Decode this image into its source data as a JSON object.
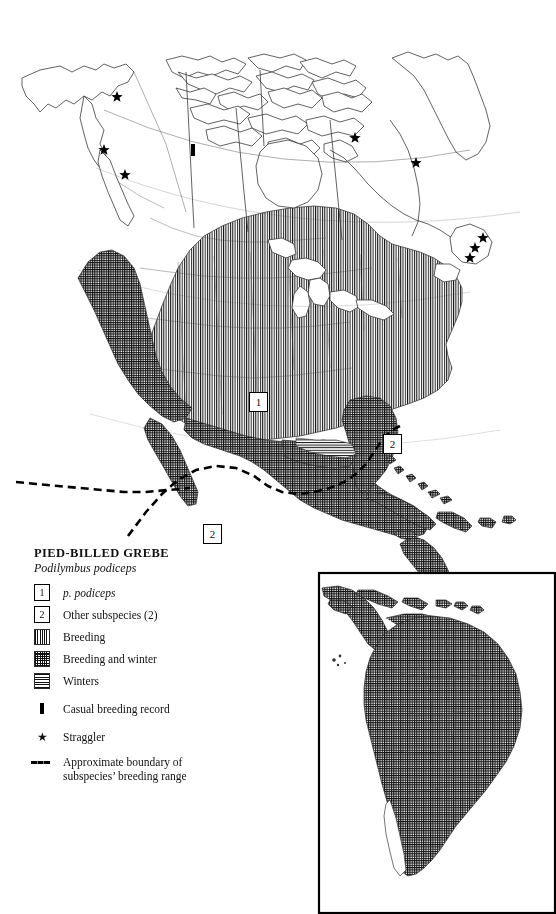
{
  "map": {
    "kind": "species-range-map",
    "region": "North America with South America inset",
    "background_color": "#ffffff",
    "ink_color": "#111111"
  },
  "legend": {
    "title": "PIED-BILLED  GREBE",
    "scientific_name": "Podilymbus podiceps",
    "subspecies": [
      {
        "number": "1",
        "label": "p. podiceps",
        "italic": true
      },
      {
        "number": "2",
        "label": "Other subspecies  (2)",
        "italic": false
      }
    ],
    "patterns": [
      {
        "swatch": "vertical-lines",
        "label": "Breeding"
      },
      {
        "swatch": "cross-hatch",
        "label": "Breeding and winter"
      },
      {
        "swatch": "horizontal-lines",
        "label": "Winters"
      }
    ],
    "marks": [
      {
        "symbol": "bar",
        "label": "Casual breeding record"
      },
      {
        "symbol": "star",
        "label": "Straggler",
        "glyph": "★"
      },
      {
        "symbol": "dashed-line",
        "label_line1": "Approximate boundary of",
        "label_line2": "subspecies’ breeding range"
      }
    ]
  },
  "map_callouts": [
    {
      "number": "1",
      "x": 249,
      "y": 392,
      "area": "central-united-states"
    },
    {
      "number": "2",
      "x": 383,
      "y": 434,
      "area": "bahamas-atlantic"
    },
    {
      "number": "2",
      "x": 203,
      "y": 524,
      "area": "southern-mexico"
    }
  ],
  "stragglers": [
    {
      "x": 117,
      "y": 97,
      "place": "yukon-alaska-border"
    },
    {
      "x": 104,
      "y": 150,
      "place": "southeast-alaska"
    },
    {
      "x": 125,
      "y": 175,
      "place": "british-columbia"
    },
    {
      "x": 355,
      "y": 138,
      "place": "northern-quebec"
    },
    {
      "x": 416,
      "y": 163,
      "place": "labrador-coast"
    },
    {
      "x": 483,
      "y": 238,
      "place": "newfoundland-north"
    },
    {
      "x": 475,
      "y": 248,
      "place": "newfoundland-central"
    },
    {
      "x": 470,
      "y": 258,
      "place": "newfoundland-south"
    }
  ],
  "casual_breeding_records": [
    {
      "x": 193,
      "y": 150,
      "place": "great-slave-lake"
    }
  ],
  "inset": {
    "name": "south-america-inset",
    "frame": {
      "x": 318,
      "y": 572,
      "width": 238,
      "height": 342
    },
    "pattern": "cross-hatch"
  },
  "colors": {
    "ink": "#111111",
    "paper": "#ffffff",
    "hatch": "#101010",
    "coastline": "#333333"
  }
}
